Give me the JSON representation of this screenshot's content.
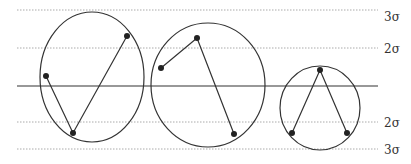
{
  "diagram": {
    "colors": {
      "stroke": "#333333",
      "guide": "#aaaaaa",
      "point": "#222222",
      "label": "#333333"
    },
    "center_line": {
      "y": 86,
      "x1": 17,
      "x2": 378
    },
    "guides": [
      {
        "id": "upper-3sigma",
        "y": 10,
        "label": "3σ",
        "label_y": 21
      },
      {
        "id": "upper-2sigma",
        "y": 48,
        "label": "2σ",
        "label_y": 53
      },
      {
        "id": "lower-2sigma",
        "y": 122,
        "label": "2σ",
        "label_y": 127
      },
      {
        "id": "lower-3sigma",
        "y": 149,
        "label": "3σ",
        "label_y": 154
      }
    ],
    "groups": [
      {
        "id": "group-1",
        "ellipse": {
          "cx": 92,
          "cy": 77,
          "rx": 52,
          "ry": 65
        },
        "points": [
          [
            46,
            76
          ],
          [
            73,
            133
          ],
          [
            127,
            36
          ]
        ]
      },
      {
        "id": "group-2",
        "ellipse": {
          "cx": 208,
          "cy": 85,
          "rx": 57,
          "ry": 62
        },
        "points": [
          [
            161,
            68
          ],
          [
            197,
            38
          ],
          [
            234,
            134
          ]
        ]
      },
      {
        "id": "group-3",
        "ellipse": {
          "cx": 320,
          "cy": 108,
          "rx": 40,
          "ry": 42
        },
        "points": [
          [
            292,
            133
          ],
          [
            320,
            70
          ],
          [
            347,
            133
          ]
        ]
      }
    ]
  }
}
